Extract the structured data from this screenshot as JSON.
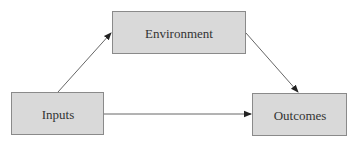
{
  "diagram": {
    "type": "flow",
    "colors": {
      "node_fill": "#d9d9d9",
      "node_border": "#8a8a8a",
      "text": "#333333",
      "edge": "#555555",
      "arrowhead": "#222222"
    },
    "nodes": [
      {
        "id": "environment",
        "label": "Environment"
      },
      {
        "id": "inputs",
        "label": "Inputs"
      },
      {
        "id": "outcomes",
        "label": "Outcomes"
      }
    ],
    "edges": [
      {
        "id": "inputs-to-environment",
        "from": "inputs",
        "to": "environment"
      },
      {
        "id": "environment-to-outcomes",
        "from": "environment",
        "to": "outcomes"
      },
      {
        "id": "inputs-to-outcomes",
        "from": "inputs",
        "to": "outcomes"
      }
    ]
  }
}
